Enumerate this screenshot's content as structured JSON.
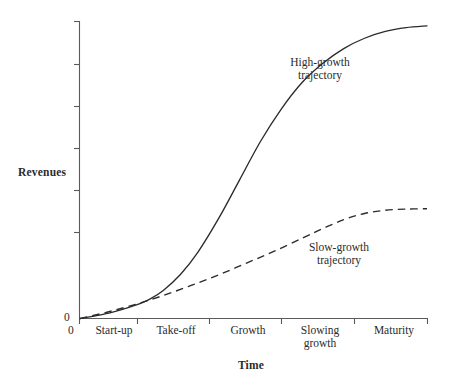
{
  "chart_data": {
    "type": "line",
    "title": "",
    "xlabel": "Time",
    "ylabel": "Revenues",
    "grid": false,
    "legend_position": "inline-annotation",
    "xlim": [
      0,
      5
    ],
    "ylim": [
      0,
      1
    ],
    "x_tick_labels": [
      "Start-up",
      "Take-off",
      "Growth",
      "Slowing growth",
      "Maturity"
    ],
    "origin_label_x": "0",
    "origin_label_y": "0",
    "series": [
      {
        "name": "High-growth trajectory",
        "style": "solid",
        "color": "#2b2b2b",
        "x": [
          0.0,
          0.3,
          0.6,
          0.8,
          1.0,
          1.2,
          1.45,
          1.7,
          2.0,
          2.3,
          2.6,
          2.9,
          3.2,
          3.5,
          3.8,
          4.1,
          4.4,
          4.7,
          5.0
        ],
        "y": [
          0.0,
          0.012,
          0.03,
          0.045,
          0.065,
          0.095,
          0.15,
          0.225,
          0.34,
          0.47,
          0.6,
          0.71,
          0.8,
          0.865,
          0.915,
          0.95,
          0.973,
          0.986,
          0.992
        ]
      },
      {
        "name": "Slow-growth trajectory",
        "style": "dashed",
        "color": "#2b2b2b",
        "x": [
          0.0,
          0.4,
          0.8,
          1.2,
          1.6,
          2.0,
          2.4,
          2.8,
          3.2,
          3.5,
          3.8,
          4.1,
          4.4,
          4.7,
          5.0
        ],
        "y": [
          0.0,
          0.022,
          0.048,
          0.078,
          0.112,
          0.148,
          0.188,
          0.228,
          0.272,
          0.305,
          0.335,
          0.356,
          0.367,
          0.371,
          0.372
        ]
      }
    ],
    "annotations": [
      {
        "text": "High-growth trajectory",
        "lines": [
          "High-growth",
          "trajectory"
        ]
      },
      {
        "text": "Slow-growth trajectory",
        "lines": [
          "Slow-growth",
          "trajectory"
        ]
      }
    ]
  },
  "labels": {
    "y_axis_title": "Revenues",
    "x_axis_title": "Time",
    "zero_y": "0",
    "zero_x": "0",
    "tick_startup": "Start-up",
    "tick_takeoff": "Take-off",
    "tick_growth": "Growth",
    "tick_slowing_line1": "Slowing",
    "tick_slowing_line2": "growth",
    "tick_maturity": "Maturity",
    "high_growth_line1": "High-growth",
    "high_growth_line2": "trajectory",
    "slow_growth_line1": "Slow-growth",
    "slow_growth_line2": "trajectory"
  },
  "colors": {
    "ink": "#2b2b2b",
    "axis": "#5a5a5a",
    "background": "#ffffff"
  }
}
